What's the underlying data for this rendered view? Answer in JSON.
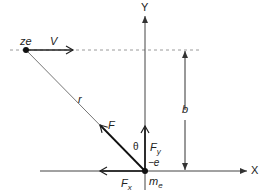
{
  "diagram": {
    "axes": {
      "x_label": "X",
      "y_label": "Y"
    },
    "particle": {
      "label": "ze",
      "velocity_label": "V"
    },
    "target": {
      "label_main": "m",
      "label_sub": "e",
      "charge_label": "−e"
    },
    "distance_label": "r",
    "impact_parameter_label": "b",
    "force": {
      "label": "F",
      "angle_label": "θ",
      "fy_main": "F",
      "fy_sub": "y",
      "fx_main": "F",
      "fx_sub": "x"
    },
    "colors": {
      "line": "#333333",
      "dashed": "#9a9a9a",
      "force": "#111111"
    }
  }
}
